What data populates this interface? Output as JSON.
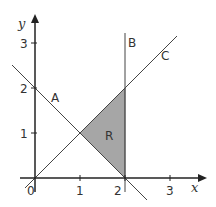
{
  "diagram": {
    "type": "coordinate-graph",
    "axes": {
      "x_label": "x",
      "y_label": "y",
      "origin_label": "0",
      "x_ticks": [
        "1",
        "2",
        "3"
      ],
      "y_ticks": [
        "1",
        "2",
        "3"
      ]
    },
    "lines": [
      {
        "name": "A",
        "equation": "x + y = 2"
      },
      {
        "name": "B",
        "equation": "x = 2"
      },
      {
        "name": "C",
        "equation": "y = x"
      }
    ],
    "region": {
      "label": "R",
      "vertices": [
        [
          1,
          1
        ],
        [
          2,
          2
        ],
        [
          2,
          0
        ]
      ],
      "fill": "#a6a6a6"
    },
    "colors": {
      "axis": "#222222",
      "line": "#444444",
      "region": "#a6a6a6"
    }
  }
}
